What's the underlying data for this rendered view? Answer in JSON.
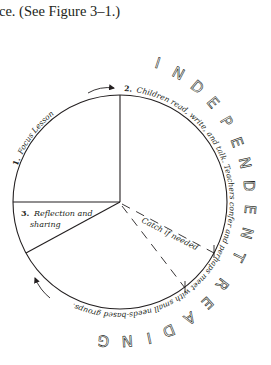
{
  "header": {
    "text": "ce. (See Figure 3–1.)"
  },
  "diagram": {
    "title_arc": "INDEPENDENT READING",
    "colors": {
      "stroke": "#231f20",
      "background": "#ffffff"
    },
    "segments": [
      {
        "number": "1.",
        "label": "Focus Lesson"
      },
      {
        "number": "2.",
        "label": "Children read, write, and talk. Teachers confer and perhaps meet with small needs-based groups."
      },
      {
        "number": "3.",
        "label_line1": "Reflection and",
        "label_line2": "sharing"
      }
    ],
    "dashed_segment": {
      "label": "Catch if needed"
    },
    "outer_letters": [
      "I",
      "N",
      "D",
      "E",
      "P",
      "E",
      "N",
      "D",
      "E",
      "N",
      "T",
      "R",
      "E",
      "A",
      "D",
      "I",
      "N",
      "G"
    ]
  }
}
